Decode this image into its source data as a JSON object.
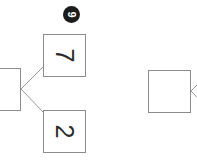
{
  "diagram": {
    "orientation_degrees": 90,
    "background_color": "#ffffff",
    "node_border_color": "#8c8c8c",
    "node_fill_color": "#ffffff",
    "edge_color": "#9a9a9a",
    "badge_fill_color": "#1c1c1c",
    "badge_text_color": "#ffffff",
    "nodes": [
      {
        "id": "root",
        "label": "",
        "name": "node-root-empty",
        "clipped": "left"
      },
      {
        "id": "seven",
        "label": "7",
        "name": "node-seven",
        "clipped": "none"
      },
      {
        "id": "two",
        "label": "2",
        "name": "node-two",
        "clipped": "none"
      },
      {
        "id": "right",
        "label": "",
        "name": "node-right-empty",
        "clipped": "right"
      }
    ],
    "badges": [
      {
        "id": "nine",
        "label": "9",
        "name": "badge-nine"
      }
    ],
    "edges": [
      {
        "from": "root",
        "to": "seven"
      },
      {
        "from": "root",
        "to": "two"
      },
      {
        "from": "right",
        "to": "offscreen-upper"
      },
      {
        "from": "right",
        "to": "offscreen-lower"
      }
    ]
  }
}
